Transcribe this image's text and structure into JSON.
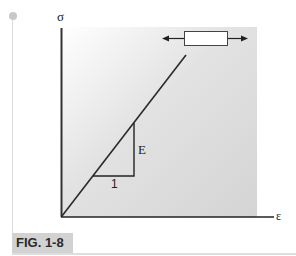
{
  "figure": {
    "label": "FIG. 1-8",
    "y_axis_symbol": "σ",
    "x_axis_symbol": "ε",
    "slope_rise_label": "E",
    "slope_run_label": "1",
    "specimen_icon": "tensile-bar-with-arrows"
  },
  "colors": {
    "shade": "#d6d6d6",
    "axis": "#222222",
    "label_bg": "#d2d2d2"
  }
}
